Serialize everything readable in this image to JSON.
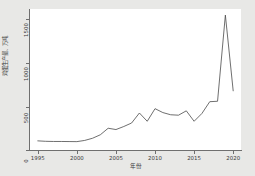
{
  "chart_data": {
    "type": "line",
    "title": "",
    "xlabel": "年份",
    "ylabel": "鸡蛋生产量、万吨",
    "xlim": [
      1994,
      2021
    ],
    "ylim": [
      0,
      1620
    ],
    "xticks": [
      1995,
      2000,
      2005,
      2010,
      2015,
      2020
    ],
    "yticks": [
      0,
      500,
      1000,
      1500
    ],
    "xtick_labels": [
      "1995",
      "2000",
      "2005",
      "2010",
      "2015",
      "2020"
    ],
    "ytick_labels": [
      "0",
      "500",
      "1000",
      "1500"
    ],
    "grid": false,
    "legend": false,
    "line_color": "#4a4a4a",
    "background_color": "#e8e8e6",
    "plot_background_color": "#ffffff",
    "series": [
      {
        "name": "生产量",
        "x": [
          1995,
          1996,
          1997,
          1998,
          1999,
          2000,
          2001,
          2002,
          2003,
          2004,
          2005,
          2006,
          2007,
          2008,
          2009,
          2010,
          2011,
          2012,
          2013,
          2014,
          2015,
          2016,
          2017,
          2018,
          2019,
          2020
        ],
        "values": [
          105,
          100,
          98,
          98,
          97,
          96,
          110,
          135,
          175,
          250,
          235,
          270,
          310,
          425,
          330,
          475,
          430,
          405,
          400,
          450,
          330,
          420,
          555,
          560,
          1550,
          680
        ]
      }
    ]
  },
  "axes": {
    "y_title": "鸡蛋生产量、万吨",
    "x_title": "年份"
  }
}
